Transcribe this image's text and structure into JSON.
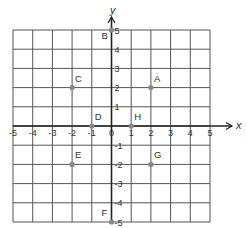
{
  "diagram": {
    "type": "coordinate-plane",
    "x_axis_label": "x",
    "y_axis_label": "y",
    "x_range": [
      -5,
      5
    ],
    "y_range": [
      -5,
      5
    ],
    "x_ticks": [
      "-5",
      "-4",
      "-3",
      "-2",
      "-1",
      "0",
      "1",
      "2",
      "3",
      "4",
      "5"
    ],
    "y_ticks": [
      "5",
      "4",
      "3",
      "2",
      "1",
      "-1",
      "-2",
      "-3",
      "-4",
      "-5"
    ],
    "grid_color": "#555555",
    "axis_color": "#222222",
    "point_color": "#888888",
    "points": [
      {
        "label": "A",
        "x": 2,
        "y": 2
      },
      {
        "label": "B",
        "x": 0,
        "y": 5
      },
      {
        "label": "C",
        "x": -2,
        "y": 2
      },
      {
        "label": "D",
        "x": -1,
        "y": 0
      },
      {
        "label": "E",
        "x": -2,
        "y": -2
      },
      {
        "label": "F",
        "x": 0,
        "y": -5
      },
      {
        "label": "G",
        "x": 2,
        "y": -2
      },
      {
        "label": "H",
        "x": 1,
        "y": 0
      }
    ]
  }
}
